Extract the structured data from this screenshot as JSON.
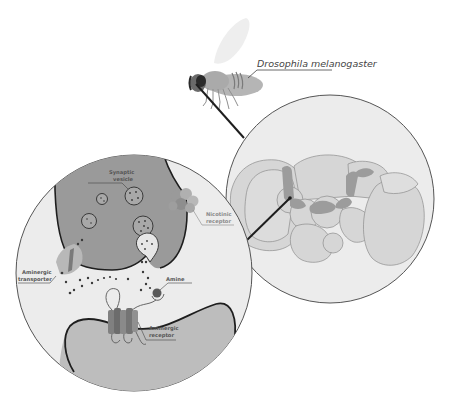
{
  "labels": {
    "species": "Drosophila melanogaster",
    "synaptic_vesicle_1": "Synaptic",
    "synaptic_vesicle_2": "vesicle",
    "nicotinic_receptor_1": "Nicotinic",
    "nicotinic_receptor_2": "receptor",
    "aminergic_transporter_1": "Aminergic",
    "aminergic_transporter_2": "transporter",
    "amine": "Amine",
    "aminergic_receptor_1": "Aminergic",
    "aminergic_receptor_2": "receptor"
  },
  "panels": {
    "fly": "Fruit fly (whole organism)",
    "brain": "Fly brain (magnified)",
    "synapse": "Synapse (magnified)"
  },
  "colors": {
    "background": "#ffffff",
    "circle_fill": "#ececec",
    "circle_stroke": "#555555",
    "presynaptic_fill": "#9a9a9a",
    "postsynaptic_fill": "#bdbdbd",
    "neuron_membrane": "#1e1e1e",
    "vesicle_fill": "#a8a8a8",
    "brain_lobe_fill": "#d6d6d6",
    "brain_lobe_stroke": "#8c8c8c",
    "brain_highlight": "#9c9c9c",
    "molecule": "#3a3a3a"
  }
}
